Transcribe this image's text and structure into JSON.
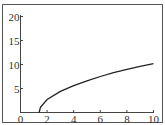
{
  "chart_data": {
    "type": "line",
    "title": "",
    "xlabel": "",
    "ylabel": "",
    "xlim": [
      0,
      10
    ],
    "ylim": [
      0,
      20
    ],
    "grid": false,
    "legend": null,
    "x_ticks": [
      "0",
      "2",
      "4",
      "6",
      "8",
      "10"
    ],
    "y_ticks": [
      "5",
      "10",
      "15",
      "20"
    ],
    "series": [
      {
        "name": "curve",
        "color": "#222222",
        "x": [
          1.4,
          1.5,
          2,
          3,
          4,
          5,
          6,
          7,
          8,
          9,
          10
        ],
        "y": [
          0,
          1.1,
          2.7,
          4.4,
          5.6,
          6.6,
          7.5,
          8.3,
          9.0,
          9.6,
          10.2
        ]
      }
    ]
  }
}
